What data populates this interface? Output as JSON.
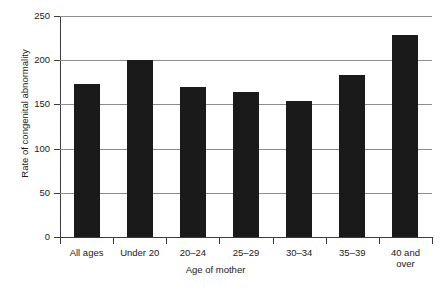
{
  "chart_data": {
    "type": "bar",
    "title": "",
    "xlabel": "Age of mother",
    "ylabel": "Rate of congenital abnormality",
    "categories": [
      "All ages",
      "Under 20",
      "20–24",
      "25–29",
      "30–34",
      "35–39",
      "40 and over"
    ],
    "values": [
      173,
      200,
      170,
      164,
      154,
      183,
      229
    ],
    "ylim": [
      0,
      250
    ],
    "yticks": [
      0,
      50,
      100,
      150,
      200,
      250
    ],
    "ytick_labels": [
      "0",
      "50",
      "100",
      "150",
      "200",
      "250"
    ],
    "grid": true,
    "legend": false,
    "legend_position": "none",
    "bar_color": "#1a1a1a",
    "grid_color": "#8c8c8c",
    "axis_color": "#3c3c3c",
    "background_color": "#ffffff"
  },
  "axis": {
    "y_title": "Rate of congenital abnormality",
    "x_title": "Age of mother"
  },
  "xtick_labels_wrapped": [
    "All ages",
    "Under 20",
    "20–24",
    "25–29",
    "30–34",
    "35–39",
    "40 and\nover"
  ]
}
